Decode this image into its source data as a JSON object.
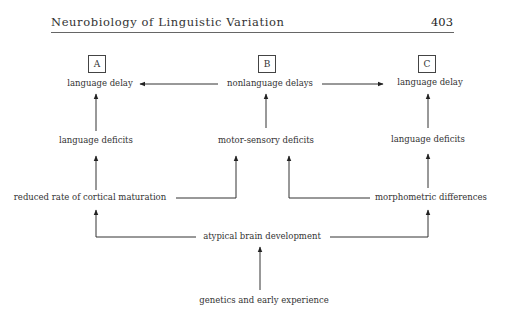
{
  "header": {
    "title": "Neurobiology of Linguistic Variation",
    "page_number": "403"
  },
  "diagram": {
    "boxes": {
      "a": "A",
      "b": "B",
      "c": "C"
    },
    "nodes": {
      "a_language_delay": "language delay",
      "b_nonlanguage_delays": "nonlanguage delays",
      "c_language_delay": "language delay",
      "a_language_deficits": "language deficits",
      "b_motor_sensory_deficits": "motor-sensory deficits",
      "c_language_deficits": "language deficits",
      "reduced_rate": "reduced rate of cortical maturation",
      "morphometric": "morphometric differences",
      "atypical_brain": "atypical brain development",
      "genetics": "genetics and early experience"
    },
    "edges": [
      {
        "from": "nonlanguage delays",
        "to": "language delay (A)"
      },
      {
        "from": "nonlanguage delays",
        "to": "language delay (C)"
      },
      {
        "from": "language deficits (A)",
        "to": "language delay (A)"
      },
      {
        "from": "motor-sensory deficits",
        "to": "nonlanguage delays"
      },
      {
        "from": "language deficits (C)",
        "to": "language delay (C)"
      },
      {
        "from": "reduced rate of cortical maturation",
        "to": "language deficits (A)"
      },
      {
        "from": "reduced rate of cortical maturation",
        "to": "motor-sensory deficits"
      },
      {
        "from": "morphometric differences",
        "to": "motor-sensory deficits"
      },
      {
        "from": "morphometric differences",
        "to": "language deficits (C)"
      },
      {
        "from": "atypical brain development",
        "to": "reduced rate of cortical maturation"
      },
      {
        "from": "atypical brain development",
        "to": "morphometric differences"
      },
      {
        "from": "genetics and early experience",
        "to": "atypical brain development"
      }
    ]
  }
}
